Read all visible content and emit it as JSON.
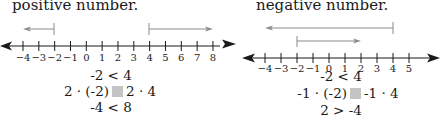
{
  "left_panel": {
    "heading": "positive number.",
    "number_line": {
      "min": -4,
      "max": 8,
      "tick_labels": [
        "-4",
        "-3",
        "-2",
        "-1",
        "0",
        "1",
        "2",
        "3",
        "4",
        "5",
        "6",
        "7",
        "8"
      ],
      "arrows": [
        {
          "from": -2,
          "to": -4,
          "direction": "left"
        },
        {
          "from": 4,
          "to": 8,
          "direction": "right"
        }
      ]
    },
    "steps": {
      "line1": "-2 < 4",
      "line2_left": "2 · (-2)",
      "line2_right": "2 · 4",
      "line3": "-4 < 8"
    }
  },
  "right_panel": {
    "heading": "negative number.",
    "number_line": {
      "min": -4,
      "max": 5,
      "tick_labels": [
        "-4",
        "-3",
        "-2",
        "-1",
        "0",
        "1",
        "2",
        "3",
        "4",
        "5"
      ],
      "arrows": [
        {
          "from": 4,
          "to": -4,
          "direction": "left"
        },
        {
          "from": -2,
          "to": 2,
          "direction": "right"
        }
      ]
    },
    "steps": {
      "line1": "-2 < 4",
      "line2_left": "-1 · (-2)",
      "line2_right": "-1 · 4",
      "line3": "2 > -4"
    }
  },
  "colors": {
    "line": "#1a1a1a",
    "arrow": "#8a8a8a",
    "placeholder_box": "#c4c4c4"
  }
}
